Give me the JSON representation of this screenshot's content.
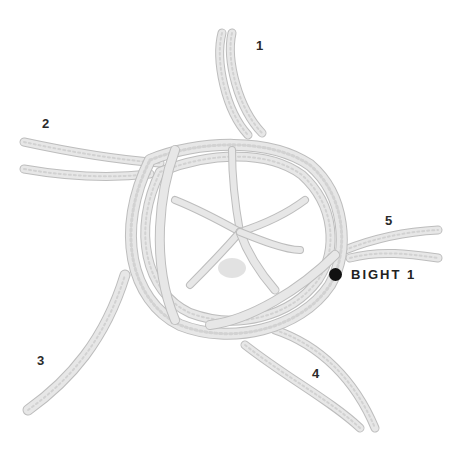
{
  "diagram": {
    "strand_labels": [
      {
        "id": "1",
        "text": "1"
      },
      {
        "id": "2",
        "text": "2"
      },
      {
        "id": "3",
        "text": "3"
      },
      {
        "id": "4",
        "text": "4"
      },
      {
        "id": "5",
        "text": "5"
      }
    ],
    "callout": {
      "marker": "dot",
      "text": "BIGHT 1"
    },
    "colors": {
      "background": "#ffffff",
      "rope": "#e7e7e7",
      "rope_shadow": "#bdbdbd",
      "marker": "#111111",
      "text": "#222222"
    }
  }
}
